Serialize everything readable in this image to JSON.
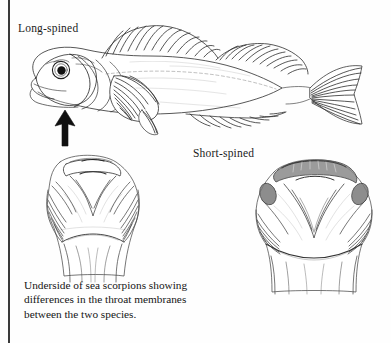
{
  "page": {
    "background_color": "#fefefe",
    "ink_color": "#1b1b1b",
    "margin_rule_color": "#3a3a3a",
    "width": 391,
    "height": 343
  },
  "labels": {
    "long_spined": "Long-spined",
    "short_spined": "Short-spined"
  },
  "caption": {
    "line1": "Underside of sea scorpions showing",
    "line2": "differences in the throat membranes",
    "line3": "between the two species."
  },
  "figures": {
    "whole_fish": {
      "name": "long-spined-sea-scorpion-lateral-view",
      "view": "lateral",
      "facing": "left"
    },
    "underside_left": {
      "name": "long-spined-throat-underside",
      "view": "ventral"
    },
    "underside_right": {
      "name": "short-spined-throat-underside",
      "view": "ventral"
    },
    "pointer": {
      "name": "arrow-pointer",
      "direction": "up",
      "color": "#101010",
      "points_at": "throat-membrane"
    }
  }
}
